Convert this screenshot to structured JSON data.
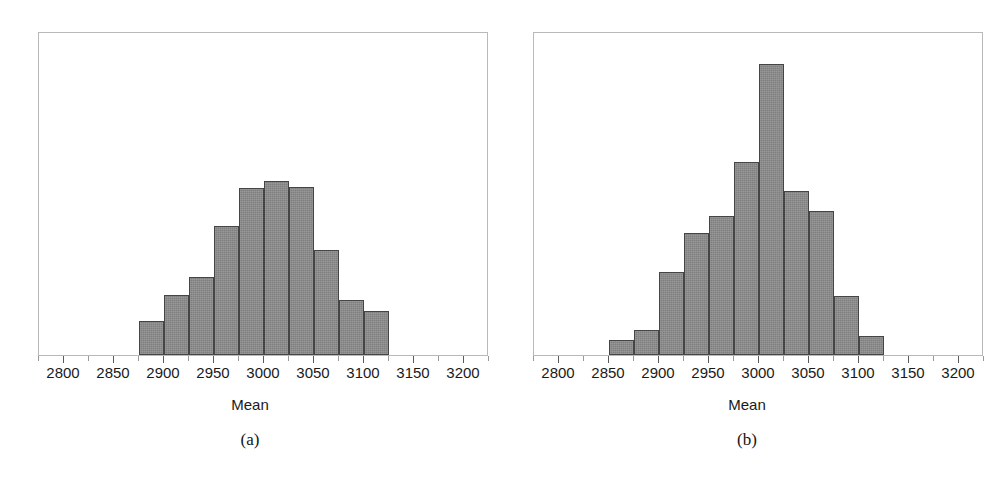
{
  "figure": {
    "panels": [
      {
        "key": "a",
        "caption": "(a)",
        "xlabel": "Mean"
      },
      {
        "key": "b",
        "caption": "(b)",
        "xlabel": "Mean"
      }
    ],
    "x_tick_labels": [
      "2800",
      "2850",
      "2900",
      "2950",
      "3000",
      "3050",
      "3100",
      "3150",
      "3200"
    ]
  },
  "chart_data": [
    {
      "type": "bar",
      "subplot": "(a)",
      "title": "",
      "xlabel": "Mean",
      "ylabel": "",
      "xlim": [
        2775,
        3225
      ],
      "ylim": [
        0,
        100
      ],
      "grid": false,
      "legend": null,
      "bin_width": 25,
      "bin_edges": [
        2875,
        2900,
        2925,
        2950,
        2975,
        3000,
        3025,
        3050,
        3075,
        3100,
        3125
      ],
      "categories": [
        "2875-2900",
        "2900-2925",
        "2925-2950",
        "2950-2975",
        "2975-3000",
        "3000-3025",
        "3025-3050",
        "3050-3075",
        "3075-3100",
        "3100-3125"
      ],
      "bin_centers": [
        2887.5,
        2912.5,
        2937.5,
        2962.5,
        2987.5,
        3012.5,
        3037.5,
        3062.5,
        3087.5,
        3112.5
      ],
      "values": [
        11,
        19,
        24,
        40,
        52,
        54,
        52,
        33,
        17,
        14
      ],
      "values_normalized_pct": [
        10.5,
        18.6,
        24.1,
        39.9,
        51.7,
        53.6,
        52.0,
        32.5,
        17.0,
        13.6
      ]
    },
    {
      "type": "bar",
      "subplot": "(b)",
      "title": "",
      "xlabel": "Mean",
      "ylabel": "",
      "xlim": [
        2775,
        3225
      ],
      "ylim": [
        0,
        100
      ],
      "grid": false,
      "legend": null,
      "bin_width": 25,
      "bin_edges": [
        2850,
        2875,
        2900,
        2925,
        2950,
        2975,
        3000,
        3025,
        3050,
        3075,
        3100,
        3125
      ],
      "categories": [
        "2850-2875",
        "2875-2900",
        "2900-2925",
        "2925-2950",
        "2950-2975",
        "2975-3000",
        "3000-3025",
        "3025-3050",
        "3050-3075",
        "3075-3100",
        "3100-3125"
      ],
      "bin_centers": [
        2862.5,
        2887.5,
        2912.5,
        2937.5,
        2962.5,
        2987.5,
        3012.5,
        3037.5,
        3062.5,
        3087.5,
        3112.5
      ],
      "values": [
        5,
        8,
        26,
        38,
        43,
        59,
        90,
        50,
        44,
        18,
        6
      ],
      "values_normalized_pct": [
        4.6,
        7.7,
        25.7,
        37.8,
        43.0,
        59.5,
        89.8,
        50.5,
        44.3,
        18.1,
        5.8
      ]
    }
  ]
}
